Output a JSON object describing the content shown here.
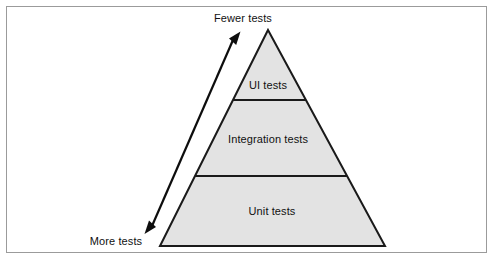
{
  "figure": {
    "kind": "test-automation-pyramid",
    "background_color": "#ffffff",
    "frame_border_color": "#9b9b9b"
  },
  "pyramid": {
    "fill_color": "#e3e3e3",
    "stroke_color": "#1a1a1a",
    "apex": {
      "x": 268,
      "y": 30
    },
    "base_left": {
      "x": 160,
      "y": 246
    },
    "base_right": {
      "x": 385,
      "y": 246
    },
    "tiers": [
      {
        "id": "ui-tests",
        "label": "UI tests",
        "order": 1,
        "position": "top",
        "divider_y": 100
      },
      {
        "id": "integration-tests",
        "label": "Integration tests",
        "order": 2,
        "position": "middle",
        "divider_y": 176
      },
      {
        "id": "unit-tests",
        "label": "Unit tests",
        "order": 3,
        "position": "bottom",
        "divider_y": null
      }
    ]
  },
  "arrow": {
    "style": "double-headed",
    "color": "#0d0d0d",
    "top_label": "Fewer tests",
    "bottom_label": "More tests",
    "top_point": {
      "x": 240,
      "y": 33
    },
    "bottom_point": {
      "x": 145,
      "y": 232
    }
  }
}
